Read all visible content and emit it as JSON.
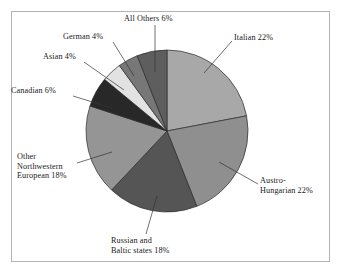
{
  "figure": {
    "frame_color": "#b4b4b4",
    "background": "#ffffff"
  },
  "chart_data": {
    "type": "pie",
    "title": "",
    "subtitle": "",
    "xlabel": "",
    "ylabel": "",
    "legend_position": "none",
    "grid": false,
    "units": "percent",
    "start_angle_deg": 0,
    "direction": "clockwise",
    "total": 100,
    "categories": [
      "Italian",
      "Austro-Hungarian",
      "Russian and Baltic states",
      "Other Northwestern European",
      "Canadian",
      "Asian",
      "German",
      "All Others"
    ],
    "values": [
      22,
      22,
      18,
      18,
      6,
      4,
      4,
      6
    ],
    "slices": [
      {
        "id": "italian",
        "name": "Italian",
        "value": 22,
        "value_text": "22%",
        "color": "#a8a8a8",
        "label_lines": [
          "Italian 22%"
        ],
        "leader": {
          "x1": 232,
          "y1": 41,
          "x2": 204,
          "y2": 73
        }
      },
      {
        "id": "austro-hungarian",
        "name": "Austro-Hungarian",
        "value": 22,
        "value_text": "22%",
        "color": "#8f8f8f",
        "label_lines": [
          "Austro-",
          "Hungarian 22%"
        ],
        "leader": {
          "x1": 258,
          "y1": 184,
          "x2": 219,
          "y2": 162
        }
      },
      {
        "id": "russian-baltic",
        "name": "Russian and Baltic states",
        "value": 18,
        "value_text": "18%",
        "color": "#555555",
        "label_lines": [
          "Russian and",
          "Baltic states 18%"
        ],
        "leader": {
          "x1": 146,
          "y1": 234,
          "x2": 157,
          "y2": 196
        }
      },
      {
        "id": "other-northwestern-european",
        "name": "Other Northwestern European",
        "value": 18,
        "value_text": "18%",
        "color": "#959595",
        "label_lines": [
          "Other",
          "Northwestern",
          "European 18%"
        ],
        "leader": {
          "x1": 77,
          "y1": 163,
          "x2": 112,
          "y2": 152
        }
      },
      {
        "id": "canadian",
        "name": "Canadian",
        "value": 6,
        "value_text": "6%",
        "color": "#282828",
        "label_lines": [
          "Canadian 6%"
        ],
        "leader": {
          "x1": 73,
          "y1": 96,
          "x2": 112,
          "y2": 108
        }
      },
      {
        "id": "asian",
        "name": "Asian",
        "value": 4,
        "value_text": "4%",
        "color": "#e2e2e2",
        "label_lines": [
          "Asian 4%"
        ],
        "leader": {
          "x1": 84,
          "y1": 62,
          "x2": 124,
          "y2": 90
        }
      },
      {
        "id": "german",
        "name": "German",
        "value": 4,
        "value_text": "4%",
        "color": "#777777",
        "label_lines": [
          "German 4%"
        ],
        "leader": {
          "x1": 113,
          "y1": 42,
          "x2": 134,
          "y2": 76
        }
      },
      {
        "id": "all-others",
        "name": "All Others",
        "value": 6,
        "value_text": "6%",
        "color": "#5e5e5e",
        "label_lines": [
          "All Others 6%"
        ],
        "leader": {
          "x1": 155,
          "y1": 25,
          "x2": 155,
          "y2": 72
        }
      }
    ],
    "geometry": {
      "center_x": 167,
      "center_y": 131,
      "radius": 81
    }
  }
}
